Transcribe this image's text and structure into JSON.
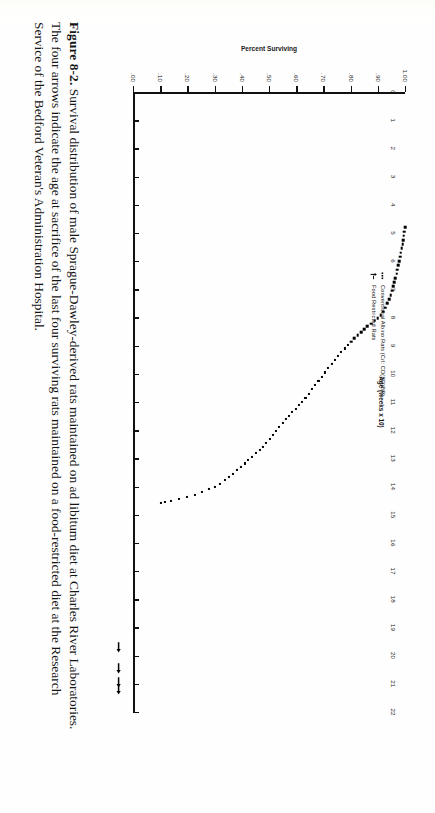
{
  "figure": {
    "label": "Figure 8-2.",
    "caption_line1": "Survival distribution of male Sprague-Dawley-derived rats maintained on ad libitum diet at Charles River Laboratories.",
    "caption_line2": "The four arrows indicate the age at sacrifice of the last four surviving rats maintained on a food-restricted diet at the Research Service",
    "caption_line3": "of the Bedford Veteran's Administration Hospital.",
    "caption_full": "Survival distribution of male Sprague-Dawley-derived rats maintained on ad libitum diet at Charles River Laboratories. The four arrows indicate the age at sacrifice of the last four surviving rats maintained on a food-restricted diet at the Research Service of the Bedford Veteran's Administration Hospital."
  },
  "legend": {
    "position": "upper-right-inside",
    "entries": [
      {
        "marker": "square-dot",
        "label": "Conventional Albino Rats (Crl: CD(SD)BR)"
      },
      {
        "marker": "up-arrow",
        "label": "Food Restricted Rats"
      }
    ]
  },
  "chart_data": {
    "type": "scatter",
    "title": "",
    "subtitle": "",
    "xlabel": "Age (weeks x 10)",
    "ylabel": "Percent Surviving",
    "xlim": [
      0,
      22
    ],
    "ylim": [
      0.0,
      1.0
    ],
    "grid": false,
    "x_ticks": [
      0,
      1,
      2,
      3,
      4,
      5,
      6,
      7,
      8,
      9,
      10,
      11,
      12,
      13,
      14,
      15,
      16,
      17,
      18,
      19,
      20,
      21,
      22
    ],
    "x_ticklabels": [
      "0",
      "1",
      "2",
      "3",
      "4",
      "5",
      "6",
      "7",
      "8",
      "9",
      "10",
      "11",
      "12",
      "13",
      "14",
      "15",
      "16",
      "17",
      "18",
      "19",
      "20",
      "21",
      "22"
    ],
    "y_ticks": [
      0.0,
      0.1,
      0.2,
      0.3,
      0.4,
      0.5,
      0.6,
      0.7,
      0.8,
      0.9,
      1.0
    ],
    "y_ticklabels": [
      ".00",
      ".10",
      ".20",
      ".30",
      ".40",
      ".50",
      ".60",
      ".70",
      ".80",
      ".90",
      "1.00"
    ],
    "series": [
      {
        "name": "Conventional Albino Rats (Crl: CD(SD)BR)",
        "marker": "square-dot",
        "color": "#000000",
        "points": [
          [
            4.8,
            1.0
          ],
          [
            4.95,
            0.998
          ],
          [
            5.1,
            0.996
          ],
          [
            5.25,
            0.994
          ],
          [
            5.4,
            0.991
          ],
          [
            5.55,
            0.988
          ],
          [
            5.7,
            0.985
          ],
          [
            5.85,
            0.982
          ],
          [
            6.0,
            0.979
          ],
          [
            6.15,
            0.976
          ],
          [
            6.3,
            0.972
          ],
          [
            6.45,
            0.969
          ],
          [
            6.6,
            0.965
          ],
          [
            6.75,
            0.961
          ],
          [
            6.9,
            0.957
          ],
          [
            7.05,
            0.952
          ],
          [
            7.2,
            0.947
          ],
          [
            7.35,
            0.941
          ],
          [
            7.5,
            0.935
          ],
          [
            7.65,
            0.928
          ],
          [
            7.8,
            0.92
          ],
          [
            7.92,
            0.911
          ],
          [
            8.02,
            0.9
          ],
          [
            8.12,
            0.888
          ],
          [
            8.22,
            0.875
          ],
          [
            8.32,
            0.862
          ],
          [
            8.42,
            0.85
          ],
          [
            8.52,
            0.838
          ],
          [
            8.62,
            0.826
          ],
          [
            8.74,
            0.814
          ],
          [
            8.86,
            0.802
          ],
          [
            8.98,
            0.79
          ],
          [
            9.1,
            0.778
          ],
          [
            9.24,
            0.766
          ],
          [
            9.38,
            0.754
          ],
          [
            9.52,
            0.742
          ],
          [
            9.66,
            0.73
          ],
          [
            9.8,
            0.718
          ],
          [
            9.95,
            0.706
          ],
          [
            10.1,
            0.694
          ],
          [
            10.25,
            0.682
          ],
          [
            10.4,
            0.67
          ],
          [
            10.55,
            0.658
          ],
          [
            10.7,
            0.646
          ],
          [
            10.85,
            0.634
          ],
          [
            11.0,
            0.622
          ],
          [
            11.12,
            0.61
          ],
          [
            11.24,
            0.598
          ],
          [
            11.36,
            0.586
          ],
          [
            11.48,
            0.574
          ],
          [
            11.6,
            0.562
          ],
          [
            11.74,
            0.55
          ],
          [
            11.88,
            0.538
          ],
          [
            12.02,
            0.526
          ],
          [
            12.16,
            0.514
          ],
          [
            12.3,
            0.502
          ],
          [
            12.44,
            0.49
          ],
          [
            12.58,
            0.478
          ],
          [
            12.7,
            0.466
          ],
          [
            12.82,
            0.452
          ],
          [
            12.94,
            0.438
          ],
          [
            13.06,
            0.424
          ],
          [
            13.18,
            0.41
          ],
          [
            13.3,
            0.396
          ],
          [
            13.42,
            0.382
          ],
          [
            13.54,
            0.368
          ],
          [
            13.66,
            0.354
          ],
          [
            13.78,
            0.338
          ],
          [
            13.9,
            0.32
          ],
          [
            14.0,
            0.3
          ],
          [
            14.1,
            0.278
          ],
          [
            14.2,
            0.254
          ],
          [
            14.3,
            0.228
          ],
          [
            14.38,
            0.198
          ],
          [
            14.45,
            0.168
          ],
          [
            14.5,
            0.14
          ],
          [
            14.54,
            0.118
          ],
          [
            14.57,
            0.104
          ]
        ]
      },
      {
        "name": "Food Restricted Rats",
        "marker": "up-arrow",
        "color": "#000000",
        "arrow_x_positions": [
          19.7,
          20.45,
          20.95,
          21.2
        ],
        "note": "four arrows indicating age at sacrifice of last four surviving food-restricted rats"
      }
    ]
  }
}
